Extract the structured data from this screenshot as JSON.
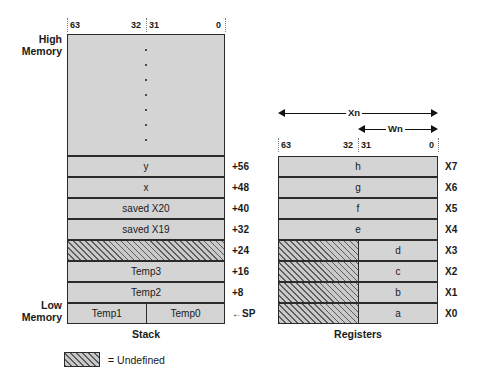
{
  "diagram": {
    "stack": {
      "caption": "Stack",
      "high_memory_label": "High\nMemory",
      "low_memory_label": "Low\nMemory",
      "bit_labels": [
        "63",
        "32",
        "31",
        "0"
      ],
      "elided_marker": "vertical-dots",
      "rows": [
        {
          "label": "y",
          "offset": "+56",
          "kind": "full",
          "split": false
        },
        {
          "label": "x",
          "offset": "+48",
          "kind": "full",
          "split": false
        },
        {
          "label": "saved X20",
          "offset": "+40",
          "kind": "full",
          "split": false
        },
        {
          "label": "saved X19",
          "offset": "+32",
          "kind": "full",
          "split": false
        },
        {
          "label": "",
          "offset": "+24",
          "kind": "undefined",
          "split": false
        },
        {
          "label": "Temp3",
          "offset": "+16",
          "kind": "full",
          "split": false
        },
        {
          "label": "Temp2",
          "offset": "+8",
          "kind": "full",
          "split": false
        },
        {
          "label_left": "Temp1",
          "label_right": "Temp0",
          "offset": "←SP",
          "kind": "full",
          "split": true
        }
      ]
    },
    "registers": {
      "caption": "Registers",
      "bit_labels": [
        "63",
        "32",
        "31",
        "0"
      ],
      "span_full": "Xn",
      "span_half": "Wn",
      "rows": [
        {
          "name": "X7",
          "value": "h",
          "upper": "defined"
        },
        {
          "name": "X6",
          "value": "g",
          "upper": "defined"
        },
        {
          "name": "X5",
          "value": "f",
          "upper": "defined"
        },
        {
          "name": "X4",
          "value": "e",
          "upper": "defined"
        },
        {
          "name": "X3",
          "value": "d",
          "upper": "undefined"
        },
        {
          "name": "X2",
          "value": "c",
          "upper": "undefined"
        },
        {
          "name": "X1",
          "value": "b",
          "upper": "undefined"
        },
        {
          "name": "X0",
          "value": "a",
          "upper": "undefined"
        }
      ]
    },
    "legend": {
      "text": "= Undefined"
    },
    "colors": {
      "cell_fill": "#d4d4d4",
      "border": "#2b2b2b",
      "hatch_line": "#5d5d5d",
      "guide": "#7a7a7a",
      "text": "#1a1a1a"
    }
  }
}
